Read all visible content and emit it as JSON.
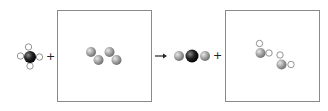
{
  "diagram": {
    "type": "chemical-reaction-particle-diagram",
    "reactants": [
      {
        "label": "methane",
        "atoms": [
          "C",
          "H",
          "H",
          "H",
          "H"
        ],
        "position": "left"
      },
      {
        "label": "oxygen-box",
        "molecules": [
          [
            "O",
            "O"
          ],
          [
            "O",
            "O"
          ]
        ]
      }
    ],
    "products": [
      {
        "label": "carbon-dioxide",
        "atoms": [
          "O",
          "C",
          "O"
        ]
      },
      {
        "label": "water-box",
        "molecules": [
          [
            "O",
            "H",
            "H"
          ],
          [
            "O",
            "H",
            "H"
          ]
        ]
      }
    ],
    "symbols": {
      "plus1": "+",
      "arrow": "→",
      "plus2": "+"
    },
    "colors": {
      "carbon": "#1a1a1a",
      "oxygen": "#9a9a9a",
      "hydrogen": "#ffffff",
      "box_border": "#8a8a8a"
    }
  }
}
